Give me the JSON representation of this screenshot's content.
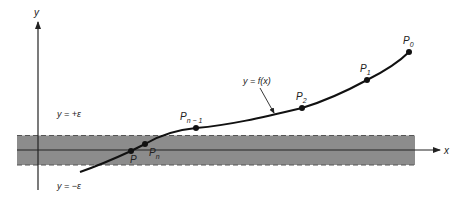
{
  "figure": {
    "axes": {
      "x_label": "x",
      "y_label": "y"
    },
    "band": {
      "upper_label": "y = +ε",
      "lower_label": "y = −ε",
      "fill_color": "#8c8c8c"
    },
    "curve": {
      "label": "y = f(x)",
      "color": "#111111"
    },
    "points": [
      {
        "name": "P",
        "sub": "0",
        "label": "P0"
      },
      {
        "name": "P",
        "sub": "1",
        "label": "P1"
      },
      {
        "name": "P",
        "sub": "2",
        "label": "P2"
      },
      {
        "name": "P",
        "sub": "n − 1",
        "label": "Pn−1"
      },
      {
        "name": "P",
        "sub": "n",
        "label": "Pn"
      },
      {
        "name": "P",
        "sub": "",
        "label": "P"
      }
    ]
  }
}
